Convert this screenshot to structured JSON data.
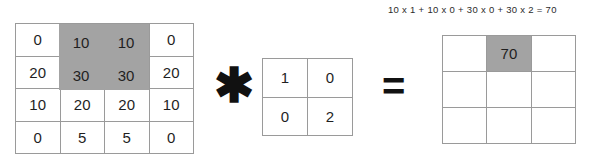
{
  "diagram": {
    "type": "convolution-illustration",
    "formula": "10 x 1 + 10 x 0 + 30 x 0 + 30 x 2 = 70",
    "operators": {
      "convolution": "✱",
      "equals": "="
    },
    "colors": {
      "highlight": "#a3a3a3",
      "grid_line": "#9a9a9a",
      "cell_background": "#ffffff",
      "text": "#1f1f1f"
    },
    "input_matrix": {
      "rows": 4,
      "cols": 4,
      "values": [
        [
          "0",
          "10",
          "10",
          "0"
        ],
        [
          "20",
          "30",
          "30",
          "20"
        ],
        [
          "10",
          "20",
          "20",
          "10"
        ],
        [
          "0",
          "5",
          "5",
          "0"
        ]
      ],
      "highlighted_cells": [
        [
          0,
          1
        ],
        [
          0,
          2
        ],
        [
          1,
          1
        ],
        [
          1,
          2
        ]
      ],
      "highlight_labels": [
        "10",
        "10",
        "30",
        "30"
      ]
    },
    "kernel_matrix": {
      "rows": 2,
      "cols": 2,
      "values": [
        [
          "1",
          "0"
        ],
        [
          "0",
          "2"
        ]
      ],
      "highlighted_cells": []
    },
    "output_matrix": {
      "rows": 3,
      "cols": 3,
      "values": [
        [
          "",
          "70",
          ""
        ],
        [
          "",
          "",
          ""
        ],
        [
          "",
          "",
          ""
        ]
      ],
      "highlighted_cells": [
        [
          0,
          1
        ]
      ]
    }
  }
}
